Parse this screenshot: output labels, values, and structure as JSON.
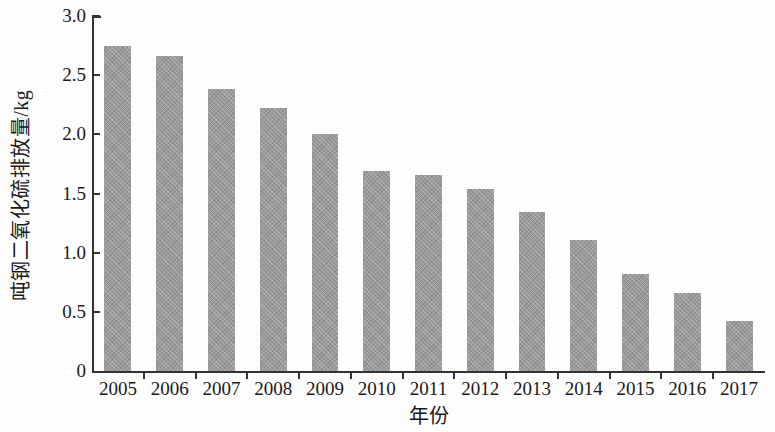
{
  "chart_data": {
    "type": "bar",
    "title": "",
    "xlabel": "年份",
    "ylabel": "吨钢二氧化硫排放量/kg",
    "categories": [
      "2005",
      "2006",
      "2007",
      "2008",
      "2009",
      "2010",
      "2011",
      "2012",
      "2013",
      "2014",
      "2015",
      "2016",
      "2017"
    ],
    "values": [
      2.75,
      2.66,
      2.38,
      2.22,
      2.0,
      1.69,
      1.66,
      1.54,
      1.34,
      1.11,
      0.82,
      0.66,
      0.42
    ],
    "series": [
      {
        "name": "吨钢二氧化硫排放量",
        "values": [
          2.75,
          2.66,
          2.38,
          2.22,
          2.0,
          1.69,
          1.66,
          1.54,
          1.34,
          1.11,
          0.82,
          0.66,
          0.42
        ]
      }
    ],
    "ylim": [
      0,
      3.0
    ],
    "y_ticks": [
      0,
      0.5,
      1.0,
      1.5,
      2.0,
      2.5,
      3.0
    ],
    "y_tick_labels": [
      "0",
      "0.5",
      "1.0",
      "1.5",
      "2.0",
      "2.5",
      "3.0"
    ],
    "grid": false,
    "legend": null,
    "bar_color": "#9a9a9a",
    "axis_color": "#333333",
    "background_color": "#ffffff"
  }
}
